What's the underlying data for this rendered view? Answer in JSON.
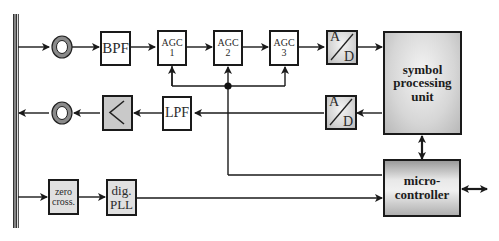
{
  "diagram": {
    "blocks": {
      "bpf": "BPF",
      "agc1_top": "AGC",
      "agc1_num": "1",
      "agc2_top": "AGC",
      "agc2_num": "2",
      "agc3_top": "AGC",
      "agc3_num": "3",
      "adc_tx_a": "A",
      "adc_tx_d": "D",
      "adc_rx_a": "A",
      "adc_rx_d": "D",
      "lpf": "LPF",
      "symbol_processing_line1": "symbol",
      "symbol_processing_line2": "processing",
      "symbol_processing_line3": "unit",
      "microcontroller_line1": "micro-",
      "microcontroller_line2": "controller",
      "zero_cross_line1": "zero",
      "zero_cross_line2": "cross.",
      "dig_pll_line1": "dig.",
      "dig_pll_line2": "PLL"
    },
    "icons": {
      "coupler_rx": "ring-coupler",
      "coupler_tx": "ring-coupler",
      "amplifier": "triangle-amplifier"
    }
  }
}
